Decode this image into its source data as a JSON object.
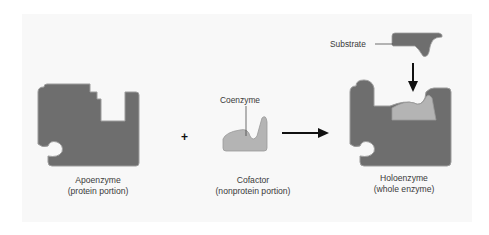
{
  "diagram": {
    "colors": {
      "enzyme_fill": "#6e6e6e",
      "enzyme_edge": "#a0a0a0",
      "coenzyme_fill": "#b4b4b4",
      "substrate_fill": "#6e6e6e",
      "arrow": "#111111",
      "text": "#3a3a3a",
      "background": "#f8f8f8"
    },
    "plus_sign": "+",
    "apoenzyme": {
      "name": "Apoenzyme",
      "desc": "(protein portion)"
    },
    "cofactor": {
      "name": "Cofactor",
      "desc": "(nonprotein portion)",
      "coenzyme_label": "Coenzyme"
    },
    "holoenzyme": {
      "name": "Holoenzyme",
      "desc": "(whole enzyme)",
      "substrate_label": "Substrate"
    }
  }
}
